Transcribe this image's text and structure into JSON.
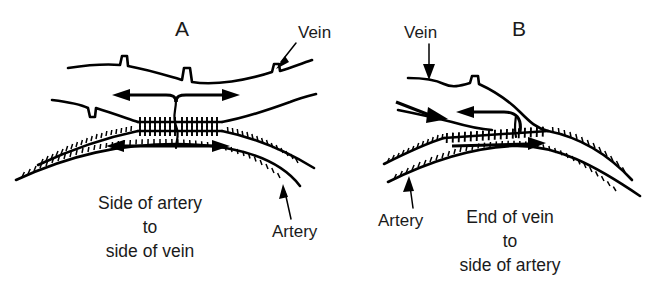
{
  "figure": {
    "background_color": "#ffffff",
    "ink_color": "#000000",
    "type": "medical-illustration"
  },
  "panels": [
    {
      "id": "A",
      "letter": "A",
      "caption": {
        "lines": [
          "Side of artery",
          "to",
          "side of vein"
        ],
        "full_text": "Side of artery to side of vein"
      },
      "labels": [
        {
          "name": "vein",
          "text": "Vein"
        },
        {
          "name": "artery",
          "text": "Artery"
        }
      ],
      "vessels": [
        {
          "name": "vein",
          "position": "upper",
          "features": [
            "valve-notches"
          ]
        },
        {
          "name": "artery",
          "position": "lower",
          "features": [
            "hatched-wall"
          ]
        }
      ],
      "flow_arrows": [
        {
          "name": "vein-flow-left",
          "direction": "left",
          "vessel": "vein"
        },
        {
          "name": "vein-flow-right",
          "direction": "right",
          "vessel": "vein"
        },
        {
          "name": "artery-flow-left",
          "direction": "left",
          "vessel": "artery"
        },
        {
          "name": "artery-flow-right",
          "direction": "right",
          "vessel": "artery"
        }
      ],
      "anastomosis": "side-to-side"
    },
    {
      "id": "B",
      "letter": "B",
      "caption": {
        "lines": [
          "End of vein",
          "to",
          "side of artery"
        ],
        "full_text": "End of vein to side of artery"
      },
      "labels": [
        {
          "name": "vein",
          "text": "Vein"
        },
        {
          "name": "artery",
          "text": "Artery"
        }
      ],
      "vessels": [
        {
          "name": "vein",
          "position": "upper",
          "features": [
            "valve-notch",
            "curves-down-to-artery"
          ]
        },
        {
          "name": "artery",
          "position": "lower",
          "features": [
            "hatched-wall"
          ]
        }
      ],
      "flow_arrows": [
        {
          "name": "vein-flow-up",
          "direction": "up-left",
          "vessel": "vein"
        },
        {
          "name": "artery-flow-in",
          "direction": "right",
          "vessel": "artery"
        },
        {
          "name": "artery-flow-right",
          "direction": "right",
          "vessel": "artery"
        }
      ],
      "anastomosis": "end-to-side"
    }
  ]
}
